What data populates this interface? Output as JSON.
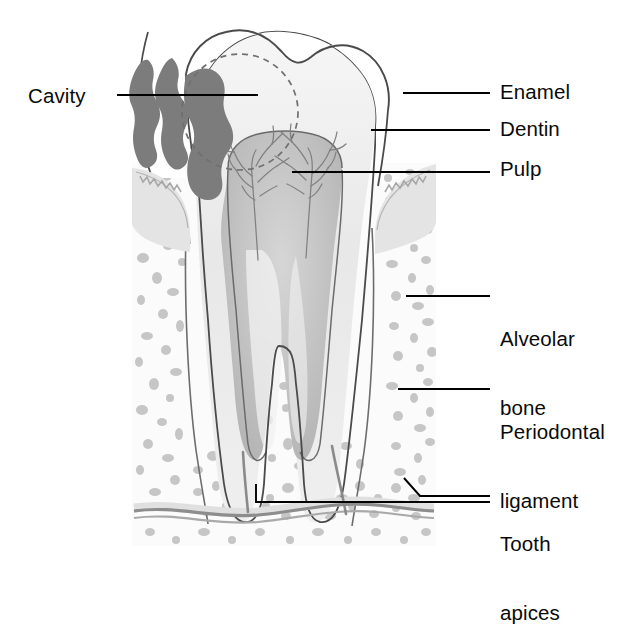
{
  "figure": {
    "type": "anatomical-illustration"
  },
  "labels": {
    "cavity": "Cavity",
    "enamel": "Enamel",
    "dentin": "Dentin",
    "pulp": "Pulp",
    "alveolar_bone_line1": "Alveolar",
    "alveolar_bone_line2": "bone",
    "periodontal_line1": "Periodontal",
    "periodontal_line2": "ligament",
    "tooth_apices_line1": "Tooth",
    "tooth_apices_line2": "apices"
  },
  "caption": {
    "text": ""
  },
  "colors": {
    "background": "#ffffff",
    "outline": "#4a4a4a",
    "leader_line": "#000000",
    "label_text": "#0a0a0a",
    "enamel_fill": "#ffffff",
    "dentin_fill": "#ececec",
    "pulp_fill": "#c0c0c0",
    "pulp_canal_fill": "#f4f4f4",
    "cavity_fill": "#7c7c7c",
    "gingiva_fill": "#e2e2e2",
    "bone_background": "#fbfbfb",
    "bone_trabeculae": "#c6c6c6",
    "cortical_band": "#8f8f8f",
    "nerve_branch": "#777777",
    "dashed_circle": "#6f6f6f"
  },
  "structures": [
    {
      "name": "enamel",
      "description": "outer white crown layer"
    },
    {
      "name": "dentin",
      "description": "light grey layer beneath enamel extending into roots"
    },
    {
      "name": "pulp",
      "description": "grey chamber with nerve branches and two root canals"
    },
    {
      "name": "cavity",
      "description": "two dark irregular carious lesions on the crown, marked by dashed circle"
    },
    {
      "name": "gingiva",
      "description": "gum tissue collar at the cervical margin"
    },
    {
      "name": "alveolar-bone",
      "description": "speckled trabecular bone surrounding the roots"
    },
    {
      "name": "periodontal-ligament",
      "description": "thin layer between root surface and bone"
    },
    {
      "name": "tooth-apices",
      "description": "two root tips at the bottom of the roots"
    }
  ]
}
